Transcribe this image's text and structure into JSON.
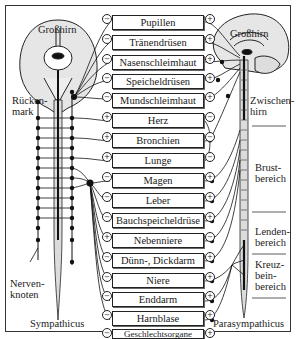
{
  "labels": {
    "brain_left": "Großhirn",
    "brain_right": "Großhirn",
    "spinal_cord": [
      "Rücken-",
      "mark"
    ],
    "ganglion": [
      "Nerven-",
      "knoten"
    ],
    "sympathetic": "Sympathicus",
    "parasympathetic": "Parasympathicus",
    "diencephalon": [
      "Zwischen-",
      "hirn"
    ],
    "thoracic": [
      "Brust-",
      "bereich"
    ],
    "lumbar": [
      "Lenden-",
      "bereich"
    ],
    "sacral": [
      "Kreuz-",
      "bein-",
      "bereich"
    ]
  },
  "organs": [
    {
      "name": "Pupillen",
      "left_sign": "−",
      "right_sign": "+"
    },
    {
      "name": "Tränendrüsen",
      "left_sign": "−",
      "right_sign": "+"
    },
    {
      "name": "Nasenschleimhaut",
      "left_sign": "−",
      "right_sign": "+"
    },
    {
      "name": "Speicheldrüsen",
      "left_sign": "−",
      "right_sign": "+"
    },
    {
      "name": "Mundschleimhaut",
      "left_sign": "−",
      "right_sign": "+"
    },
    {
      "name": "Herz",
      "left_sign": "+",
      "right_sign": "−"
    },
    {
      "name": "Bronchien",
      "left_sign": "+",
      "right_sign": "−"
    },
    {
      "name": "Lunge",
      "left_sign": "+",
      "right_sign": "−"
    },
    {
      "name": "Magen",
      "left_sign": "−",
      "right_sign": "+"
    },
    {
      "name": "Leber",
      "left_sign": "−",
      "right_sign": "+"
    },
    {
      "name": "Bauchspeicheldrüse",
      "left_sign": "−",
      "right_sign": "+"
    },
    {
      "name": "Nebenniere",
      "left_sign": "+",
      "right_sign": "−"
    },
    {
      "name": "Dünn-, Dickdarm",
      "left_sign": "−",
      "right_sign": "+"
    },
    {
      "name": "Niere",
      "left_sign": "−",
      "right_sign": "+"
    },
    {
      "name": "Enddarm",
      "left_sign": "−",
      "right_sign": "+"
    },
    {
      "name": "Harnblase",
      "left_sign": "−",
      "right_sign": "+"
    },
    {
      "name": "Geschlechtsorgane",
      "left_sign": "−",
      "right_sign": "+"
    }
  ],
  "colors": {
    "line": "#1a1a1a",
    "brain_fill": "#e6e6e6",
    "cord_fill": "#d9d9d9"
  }
}
